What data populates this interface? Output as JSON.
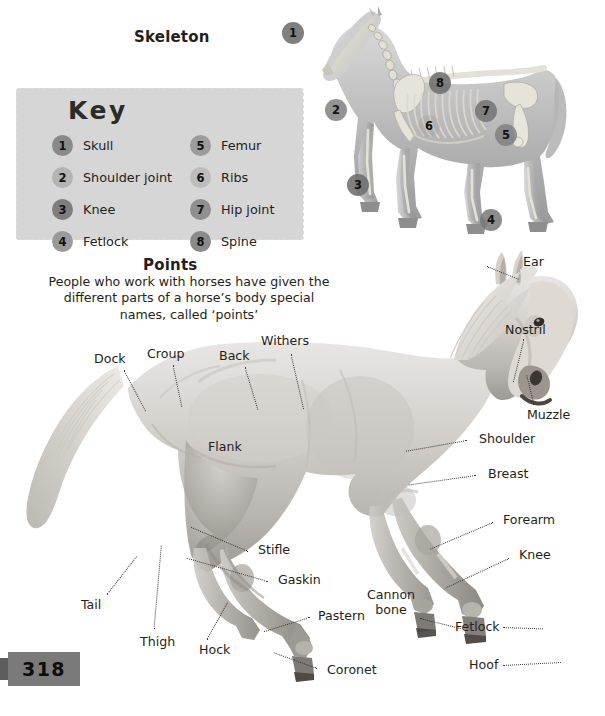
{
  "page": {
    "number": "318",
    "background": "#ffffff"
  },
  "skeleton_section": {
    "title": "Skeleton",
    "key": {
      "title": "Key",
      "panel_color": "#d6d6d6",
      "items": [
        {
          "number": "1",
          "label": "Skull",
          "dot_color": "#8a8a8a"
        },
        {
          "number": "2",
          "label": "Shoulder joint",
          "dot_color": "#b4b4b4"
        },
        {
          "number": "3",
          "label": "Knee",
          "dot_color": "#7e7e7e"
        },
        {
          "number": "4",
          "label": "Fetlock",
          "dot_color": "#9a9a9a"
        },
        {
          "number": "5",
          "label": "Femur",
          "dot_color": "#9c9c9c"
        },
        {
          "number": "6",
          "label": "Ribs",
          "dot_color": "#bdbdbd"
        },
        {
          "number": "7",
          "label": "Hip joint",
          "dot_color": "#8f8f8f"
        },
        {
          "number": "8",
          "label": "Spine",
          "dot_color": "#8a8a8a"
        }
      ]
    },
    "markers": [
      {
        "number": "1",
        "x": 14,
        "y": 16,
        "color": "rgba(110,110,110,0.88)"
      },
      {
        "number": "2",
        "x": 57,
        "y": 93,
        "color": "rgba(120,120,120,0.80)"
      },
      {
        "number": "3",
        "x": 79,
        "y": 168,
        "color": "rgba(110,110,110,0.88)"
      },
      {
        "number": "4",
        "x": 212,
        "y": 203,
        "color": "rgba(120,120,120,0.85)"
      },
      {
        "number": "5",
        "x": 227,
        "y": 118,
        "color": "rgba(125,125,125,0.80)"
      },
      {
        "number": "6",
        "x": 150,
        "y": 109,
        "color": "rgba(150,150,150,0.40)"
      },
      {
        "number": "7",
        "x": 207,
        "y": 94,
        "color": "rgba(115,115,115,0.85)"
      },
      {
        "number": "8",
        "x": 161,
        "y": 66,
        "color": "rgba(110,110,110,0.88)"
      }
    ]
  },
  "points_section": {
    "title": "Points",
    "blurb": "People who work with horses have given the different parts of a horse’s body special names, called ‘points’",
    "labels": [
      {
        "name": "ear",
        "text": "Ear",
        "x": 523,
        "y": 255,
        "line": {
          "x": -36,
          "y": 11,
          "len": 34,
          "angle": 22
        }
      },
      {
        "name": "nostril",
        "text": "Nostril",
        "x": 505,
        "y": 323,
        "line": {
          "x": -6,
          "y": 16,
          "len": 44,
          "angle": 104
        }
      },
      {
        "name": "muzzle",
        "text": "Muzzle",
        "x": 527,
        "y": 408,
        "line": {
          "x": 6,
          "y": -4,
          "len": 30,
          "angle": -104
        }
      },
      {
        "name": "shoulder",
        "text": "Shoulder",
        "x": 479,
        "y": 432,
        "line": {
          "x": -12,
          "y": 8,
          "len": 62,
          "angle": 170
        }
      },
      {
        "name": "breast",
        "text": "Breast",
        "x": 488,
        "y": 467,
        "line": {
          "x": -12,
          "y": 8,
          "len": 68,
          "angle": 172
        }
      },
      {
        "name": "forearm",
        "text": "Forearm",
        "x": 503,
        "y": 513,
        "line": {
          "x": -10,
          "y": 9,
          "len": 68,
          "angle": 157
        }
      },
      {
        "name": "knee",
        "text": "Knee",
        "x": 519,
        "y": 548,
        "line": {
          "x": -10,
          "y": 10,
          "len": 70,
          "angle": 155
        }
      },
      {
        "name": "fetlock",
        "text": "Fetlock",
        "x": 455,
        "y": 620,
        "line": {
          "x": 48,
          "y": 7,
          "len": 40,
          "angle": 2
        }
      },
      {
        "name": "hoof",
        "text": "Hoof",
        "x": 469,
        "y": 658,
        "line": {
          "x": 34,
          "y": 7,
          "len": 58,
          "angle": -3
        }
      },
      {
        "name": "cannon-bone",
        "text": "Cannon bone",
        "x": 362,
        "y": 588,
        "wrap": true,
        "line": {
          "x": 58,
          "y": 30,
          "len": 42,
          "angle": 14
        }
      },
      {
        "name": "pastern",
        "text": "Pastern",
        "x": 318,
        "y": 609,
        "line": {
          "x": -8,
          "y": 8,
          "len": 48,
          "angle": 163
        }
      },
      {
        "name": "coronet",
        "text": "Coronet",
        "x": 327,
        "y": 663,
        "line": {
          "x": -10,
          "y": 5,
          "len": 46,
          "angle": 200
        }
      },
      {
        "name": "hock",
        "text": "Hock",
        "x": 199,
        "y": 643,
        "line": {
          "x": 8,
          "y": -4,
          "len": 42,
          "angle": -61
        }
      },
      {
        "name": "thigh",
        "text": "Thigh",
        "x": 140,
        "y": 635,
        "line": {
          "x": 14,
          "y": -6,
          "len": 84,
          "angle": -85
        }
      },
      {
        "name": "tail",
        "text": "Tail",
        "x": 81,
        "y": 598,
        "line": {
          "x": 26,
          "y": -4,
          "len": 48,
          "angle": -52
        }
      },
      {
        "name": "gaskin",
        "text": "Gaskin",
        "x": 278,
        "y": 573,
        "line": {
          "x": -10,
          "y": 8,
          "len": 84,
          "angle": 196
        }
      },
      {
        "name": "stifle",
        "text": "Stifle",
        "x": 258,
        "y": 543,
        "line": {
          "x": -10,
          "y": 8,
          "len": 62,
          "angle": 203
        }
      },
      {
        "name": "flank",
        "text": "Flank",
        "x": 208,
        "y": 440
      },
      {
        "name": "dock",
        "text": "Dock",
        "x": 94,
        "y": 352,
        "line": {
          "x": 30,
          "y": 18,
          "len": 46,
          "angle": 62
        }
      },
      {
        "name": "croup",
        "text": "Croup",
        "x": 147,
        "y": 347,
        "line": {
          "x": 26,
          "y": 18,
          "len": 42,
          "angle": 78
        }
      },
      {
        "name": "back",
        "text": "Back",
        "x": 219,
        "y": 349,
        "line": {
          "x": 26,
          "y": 18,
          "len": 44,
          "angle": 73
        }
      },
      {
        "name": "withers",
        "text": "Withers",
        "x": 261,
        "y": 334,
        "line": {
          "x": 30,
          "y": 20,
          "len": 56,
          "angle": 77
        }
      }
    ]
  }
}
